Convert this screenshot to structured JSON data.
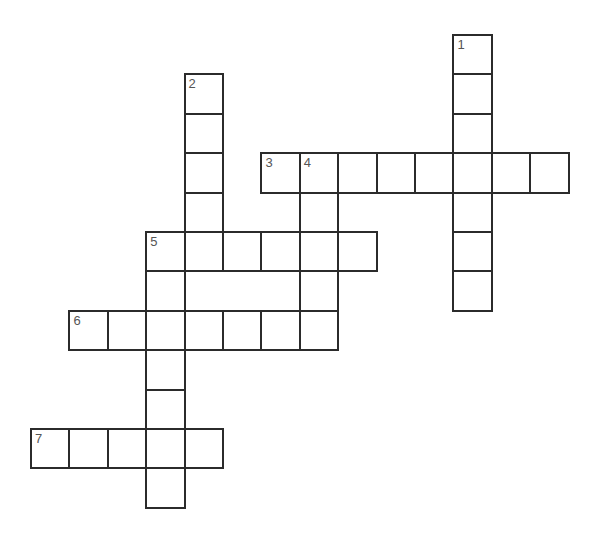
{
  "puzzle": {
    "type": "crossword",
    "grid": {
      "origin_x": 31,
      "origin_y": 35,
      "col_pitch": 38.4,
      "row_pitch": 39.4
    },
    "entries": [
      {
        "number": "1",
        "direction": "down",
        "row": 0,
        "col": 11,
        "length": 7
      },
      {
        "number": "2",
        "direction": "down",
        "row": 1,
        "col": 4,
        "length": 5
      },
      {
        "number": "3",
        "direction": "across",
        "row": 3,
        "col": 6,
        "length": 8
      },
      {
        "number": "4",
        "direction": "down",
        "row": 3,
        "col": 7,
        "length": 5
      },
      {
        "number": "5",
        "direction": "across",
        "row": 5,
        "col": 3,
        "length": 6
      },
      {
        "number": "5",
        "direction": "down",
        "row": 5,
        "col": 3,
        "length": 7
      },
      {
        "number": "6",
        "direction": "across",
        "row": 7,
        "col": 1,
        "length": 6
      },
      {
        "number": "7",
        "direction": "across",
        "row": 10,
        "col": 0,
        "length": 5
      }
    ],
    "colors": {
      "border": "#2b2b2b",
      "number": "#555555",
      "background": "#ffffff"
    }
  }
}
